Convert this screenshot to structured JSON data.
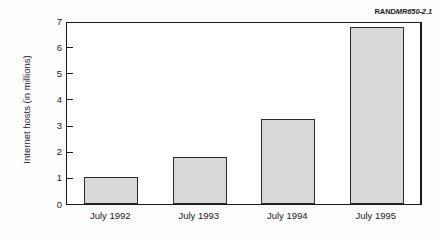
{
  "figure": {
    "report_id_prefix": "RAND",
    "report_id_number": "MR650-2.1"
  },
  "chart_data": {
    "type": "bar",
    "title": "",
    "subtitle": "",
    "xlabel": "",
    "ylabel": "Internet hosts (in millions)",
    "categories": [
      "July 1992",
      "July 1993",
      "July 1994",
      "July 1995"
    ],
    "values": [
      1.03,
      1.78,
      3.27,
      6.77
    ],
    "series": [
      {
        "name": "Internet hosts",
        "values": [
          1.03,
          1.78,
          3.27,
          6.77
        ]
      }
    ],
    "ylim": [
      0,
      7
    ],
    "ytick_labels": [
      "0",
      "1",
      "2",
      "3",
      "4",
      "5",
      "6",
      "7"
    ],
    "ytick_values": [
      0,
      1,
      2,
      3,
      4,
      5,
      6,
      7
    ],
    "grid": false,
    "legend": false,
    "legend_position": "none",
    "bar_fill_color": "#d9d9d9",
    "bar_edge_color": "#2a2a2a",
    "axis_color": "#1a1a1a",
    "background_color": "#ffffff"
  }
}
